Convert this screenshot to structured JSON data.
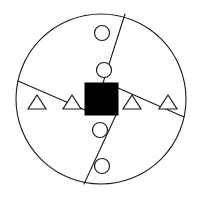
{
  "figure": {
    "name": "partitioned-circle-shape-diagram",
    "background_color": "#ffffff",
    "stroke_color": "#1a1a1a",
    "fill_color": "#ffffff",
    "solid_color": "#000000",
    "canvas": {
      "width": 199,
      "height": 200
    }
  },
  "boundary": {
    "type": "circle",
    "label": "outer-circle",
    "cx": 101,
    "cy": 99,
    "r": 85
  },
  "center_marker": {
    "type": "square",
    "label": "center-black-square",
    "x": 85,
    "y": 83,
    "width": 33,
    "height": 32,
    "fill": "#000000"
  },
  "dividers": [
    {
      "label": "divider-upper",
      "x1": 125,
      "y1": 14,
      "x2": 103,
      "y2": 83
    },
    {
      "label": "divider-lower",
      "x1": 116,
      "y1": 115,
      "x2": 84,
      "y2": 184
    },
    {
      "label": "divider-left",
      "x1": 18,
      "y1": 81,
      "x2": 85,
      "y2": 110
    },
    {
      "label": "divider-right",
      "x1": 118,
      "y1": 88,
      "x2": 184,
      "y2": 117
    }
  ],
  "circles": [
    {
      "label": "circle-top-1",
      "cx": 102,
      "cy": 33,
      "r": 7.5
    },
    {
      "label": "circle-top-2",
      "cx": 104,
      "cy": 70,
      "r": 7.5
    },
    {
      "label": "circle-bottom-1",
      "cx": 100,
      "cy": 130,
      "r": 7.5
    },
    {
      "label": "circle-bottom-2",
      "cx": 102,
      "cy": 166,
      "r": 7.5
    }
  ],
  "triangles": [
    {
      "label": "triangle-left-outer",
      "cx": 37,
      "cy": 102,
      "half_width": 9,
      "height": 14
    },
    {
      "label": "triangle-left-inner",
      "cx": 72,
      "cy": 102,
      "half_width": 9,
      "height": 14
    },
    {
      "label": "triangle-right-inner",
      "cx": 132,
      "cy": 102,
      "half_width": 9,
      "height": 14
    },
    {
      "label": "triangle-right-outer",
      "cx": 168,
      "cy": 102,
      "half_width": 9,
      "height": 14
    }
  ],
  "counts": {
    "circles": 4,
    "triangles": 4,
    "squares": 1,
    "sectors": 4
  }
}
